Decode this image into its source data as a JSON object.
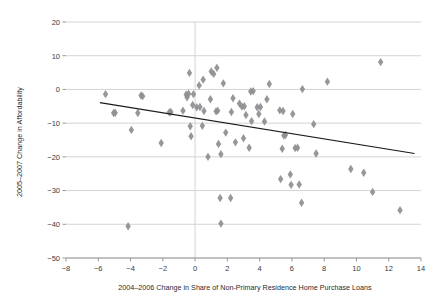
{
  "chart_data": {
    "type": "scatter",
    "title": "",
    "xlabel": "2004–2006 Change in Share of Non-Primary Residence Home Purchase Loans",
    "ylabel": "2005–2007 Change in Affordability",
    "xlim": [
      -8,
      14
    ],
    "ylim": [
      -50,
      20
    ],
    "xticks": [
      -8,
      -6,
      -4,
      -2,
      0,
      2,
      4,
      6,
      8,
      10,
      12,
      14
    ],
    "xtick_labels": [
      "−8",
      "−6",
      "−4",
      "−2",
      "0",
      "2",
      "4",
      "6",
      "8",
      "10",
      "12",
      "14"
    ],
    "yticks": [
      20,
      10,
      0,
      -10,
      -20,
      -30,
      -40,
      -50
    ],
    "ytick_labels": [
      "20",
      "10",
      "0",
      "−10",
      "−20",
      "−30",
      "−40",
      "−50"
    ],
    "grid": "horizontal",
    "grid_color": "#cfcfcf",
    "marker": "diamond",
    "marker_color": "#8e8e92",
    "marker_size": 4.2,
    "legend": null,
    "zero_line_x": 0,
    "trendline": {
      "label": "linear fit",
      "color": "#1a1a1a",
      "x_start": -5.9,
      "y_start": -3.9,
      "x_end": 13.6,
      "y_end": -19.0
    },
    "points": [
      {
        "x": -5.55,
        "y": -1.4
      },
      {
        "x": -5.05,
        "y": -7.0
      },
      {
        "x": -4.95,
        "y": -6.9
      },
      {
        "x": -4.15,
        "y": -40.6
      },
      {
        "x": -3.95,
        "y": -12.0
      },
      {
        "x": -3.55,
        "y": -7.0
      },
      {
        "x": -3.35,
        "y": -1.8
      },
      {
        "x": -3.25,
        "y": -2.0
      },
      {
        "x": -2.1,
        "y": -15.9
      },
      {
        "x": -1.6,
        "y": -6.8
      },
      {
        "x": -1.5,
        "y": -6.7
      },
      {
        "x": -0.75,
        "y": -6.3
      },
      {
        "x": -0.55,
        "y": -1.5
      },
      {
        "x": -0.5,
        "y": -2.3
      },
      {
        "x": -0.4,
        "y": -1.3
      },
      {
        "x": -0.35,
        "y": 4.9
      },
      {
        "x": -0.3,
        "y": -10.9
      },
      {
        "x": -0.25,
        "y": -13.9
      },
      {
        "x": -0.15,
        "y": -4.6
      },
      {
        "x": -0.1,
        "y": -1.4
      },
      {
        "x": 0.1,
        "y": -5.3
      },
      {
        "x": 0.25,
        "y": 1.2
      },
      {
        "x": 0.3,
        "y": -5.2
      },
      {
        "x": 0.45,
        "y": -10.8
      },
      {
        "x": 0.5,
        "y": 2.9
      },
      {
        "x": 0.55,
        "y": -6.4
      },
      {
        "x": 0.8,
        "y": -20.0
      },
      {
        "x": 0.95,
        "y": -2.9
      },
      {
        "x": 1.0,
        "y": 5.3
      },
      {
        "x": 1.15,
        "y": 4.6
      },
      {
        "x": 1.3,
        "y": -6.5
      },
      {
        "x": 1.35,
        "y": 6.4
      },
      {
        "x": 1.4,
        "y": -6.3
      },
      {
        "x": 1.45,
        "y": -16.2
      },
      {
        "x": 1.55,
        "y": -32.2
      },
      {
        "x": 1.6,
        "y": -19.2
      },
      {
        "x": 1.6,
        "y": -39.8
      },
      {
        "x": 1.75,
        "y": 1.8
      },
      {
        "x": 1.9,
        "y": -12.8
      },
      {
        "x": 2.2,
        "y": -32.2
      },
      {
        "x": 2.25,
        "y": -6.7
      },
      {
        "x": 2.35,
        "y": -2.6
      },
      {
        "x": 2.5,
        "y": -15.7
      },
      {
        "x": 2.75,
        "y": -4.2
      },
      {
        "x": 2.9,
        "y": -5.1
      },
      {
        "x": 3.0,
        "y": -14.5
      },
      {
        "x": 3.05,
        "y": -5.0
      },
      {
        "x": 3.15,
        "y": -7.6
      },
      {
        "x": 3.35,
        "y": -17.3
      },
      {
        "x": 3.45,
        "y": -0.6
      },
      {
        "x": 3.5,
        "y": -9.4
      },
      {
        "x": 3.6,
        "y": -0.5
      },
      {
        "x": 3.85,
        "y": -5.3
      },
      {
        "x": 3.95,
        "y": -7.3
      },
      {
        "x": 4.05,
        "y": -5.2
      },
      {
        "x": 4.3,
        "y": -9.5
      },
      {
        "x": 4.45,
        "y": -2.9
      },
      {
        "x": 4.6,
        "y": 1.6
      },
      {
        "x": 5.25,
        "y": -6.2
      },
      {
        "x": 5.3,
        "y": -26.6
      },
      {
        "x": 5.4,
        "y": -17.6
      },
      {
        "x": 5.45,
        "y": -6.4
      },
      {
        "x": 5.5,
        "y": -13.7
      },
      {
        "x": 5.6,
        "y": -13.5
      },
      {
        "x": 5.9,
        "y": -25.2
      },
      {
        "x": 5.95,
        "y": -28.3
      },
      {
        "x": 6.05,
        "y": -7.3
      },
      {
        "x": 6.2,
        "y": -17.4
      },
      {
        "x": 6.35,
        "y": -17.3
      },
      {
        "x": 6.45,
        "y": -28.2
      },
      {
        "x": 6.6,
        "y": -33.6
      },
      {
        "x": 6.65,
        "y": 0.1
      },
      {
        "x": 7.35,
        "y": -10.3
      },
      {
        "x": 7.5,
        "y": -19.0
      },
      {
        "x": 8.2,
        "y": 2.3
      },
      {
        "x": 9.65,
        "y": -23.6
      },
      {
        "x": 10.45,
        "y": -24.7
      },
      {
        "x": 11.0,
        "y": -30.4
      },
      {
        "x": 11.5,
        "y": 8.1
      },
      {
        "x": 12.7,
        "y": -35.8
      }
    ]
  },
  "figure": {
    "background": "#ffffff",
    "axis_color": "#9a9a9a"
  }
}
